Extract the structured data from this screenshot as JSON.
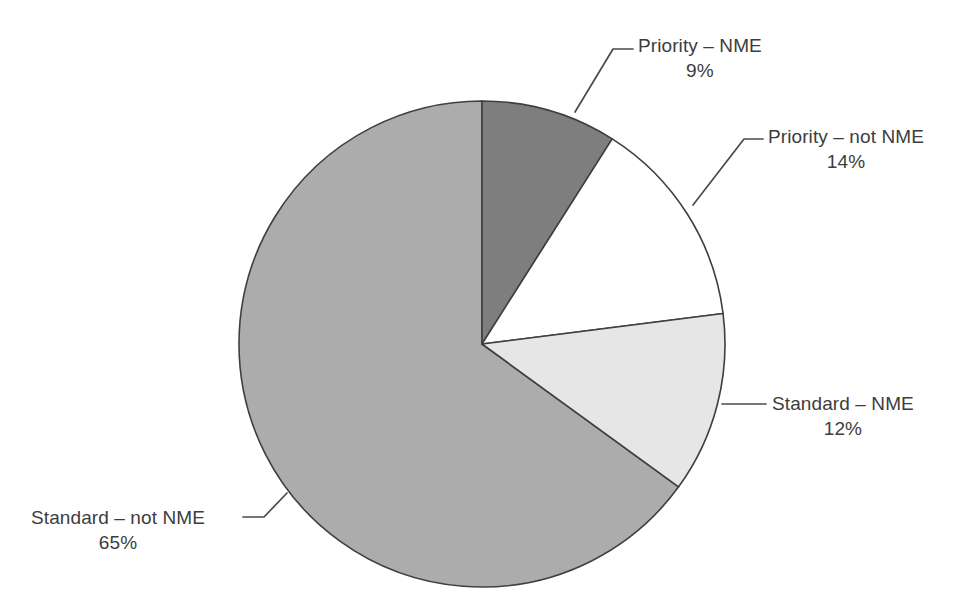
{
  "chart_data": {
    "type": "pie",
    "title": "",
    "subtitle": "",
    "xlabel": "",
    "ylabel": "",
    "legend_position": "none",
    "grid": false,
    "value_unit": "percent",
    "start_angle_deg": 0,
    "direction": "clockwise",
    "categories": [
      "Priority – NME",
      "Priority – not NME",
      "Standard – NME",
      "Standard – not NME"
    ],
    "values": [
      9,
      14,
      12,
      65
    ],
    "slices": [
      {
        "label": "Priority – NME",
        "value": 9,
        "value_text": "9%",
        "color": "#7e7e7e",
        "stroke": "#3f3f3f"
      },
      {
        "label": "Priority – not NME",
        "value": 14,
        "value_text": "14%",
        "color": "#ffffff",
        "stroke": "#3f3f3f"
      },
      {
        "label": "Standard – NME",
        "value": 12,
        "value_text": "12%",
        "color": "#e6e6e6",
        "stroke": "#3f3f3f"
      },
      {
        "label": "Standard – not NME",
        "value": 65,
        "value_text": "65%",
        "color": "#acacac",
        "stroke": "#3f3f3f"
      }
    ]
  },
  "labels": {
    "priority_nme": {
      "name": "Priority – NME",
      "value": "9%"
    },
    "priority_not_nme": {
      "name": "Priority – not NME",
      "value": "14%"
    },
    "standard_nme": {
      "name": "Standard – NME",
      "value": "12%"
    },
    "standard_not_nme": {
      "name": "Standard – not NME",
      "value": "65%"
    }
  },
  "colors": {
    "background": "#ffffff",
    "text": "#3d3d3d",
    "outline": "#3f3f3f",
    "leader_line": "#4a4a4a"
  }
}
